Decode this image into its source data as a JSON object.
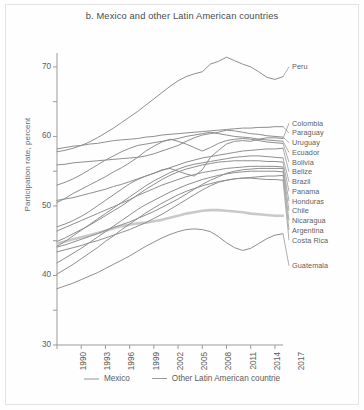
{
  "figure": {
    "panel_letter": "b.",
    "title": "b.  Mexico and other Latin American countries",
    "ylabel": "Participation rate, percent",
    "border_color": "#e3e3e3",
    "background": "#fefefe"
  },
  "legend": {
    "position": "bottom-center",
    "items": [
      {
        "label": "Mexico",
        "color": "#c9c9c9",
        "width": 2.6
      },
      {
        "label": "Other Latin American countrie",
        "color": "#9a9a9a",
        "width": 1.0
      }
    ]
  },
  "chart_data": {
    "type": "line",
    "title": "b.  Mexico and other Latin American countries",
    "xlabel": "",
    "ylabel": "Participation rate, percent",
    "xlim": [
      1990,
      2018
    ],
    "ylim": [
      30,
      72
    ],
    "grid": false,
    "legend_position": "bottom-center",
    "yticks": [
      30,
      40,
      50,
      60,
      70
    ],
    "yticks_minor": [
      35,
      45,
      55,
      65
    ],
    "xticks": [
      1990,
      1993,
      1996,
      1999,
      2002,
      2005,
      2008,
      2011,
      2014,
      2017
    ],
    "x": [
      1990,
      1991,
      1992,
      1993,
      1994,
      1995,
      1996,
      1997,
      1998,
      1999,
      2000,
      2001,
      2002,
      2003,
      2004,
      2005,
      2006,
      2007,
      2008,
      2009,
      2010,
      2011,
      2012,
      2013,
      2014,
      2015,
      2016,
      2017,
      2018
    ],
    "series": [
      {
        "name": "Peru",
        "color": "#8e8e8e",
        "width": 1.0,
        "label_y": 70.0,
        "values": [
          57.8,
          58.0,
          58.3,
          58.7,
          59.2,
          59.8,
          60.5,
          61.2,
          62.0,
          62.8,
          63.6,
          64.5,
          65.4,
          66.3,
          67.2,
          68.0,
          68.6,
          69.0,
          69.3,
          70.4,
          70.8,
          71.4,
          70.9,
          70.4,
          70.0,
          69.3,
          68.5,
          68.2,
          68.6
        ]
      },
      {
        "name": "Colombia",
        "color": "#8e8e8e",
        "width": 1.0,
        "label_y": 61.9,
        "values": [
          47.0,
          47.4,
          47.9,
          48.5,
          49.2,
          50.0,
          50.8,
          51.6,
          52.4,
          53.2,
          53.8,
          54.3,
          54.7,
          55.2,
          55.4,
          55.0,
          54.6,
          54.3,
          55.2,
          57.0,
          58.0,
          58.9,
          59.3,
          59.4,
          59.3,
          59.6,
          59.8,
          59.8,
          59.7
        ]
      },
      {
        "name": "Paraguay",
        "color": "#8e8e8e",
        "width": 1.0,
        "label_y": 60.5,
        "values": [
          58.2,
          58.4,
          58.6,
          58.7,
          58.9,
          59.0,
          59.2,
          59.4,
          59.5,
          59.6,
          59.7,
          59.9,
          60.0,
          60.2,
          60.3,
          60.4,
          60.5,
          60.6,
          60.7,
          60.8,
          60.9,
          61.0,
          61.1,
          61.2,
          61.2,
          61.3,
          61.3,
          61.4,
          61.4
        ]
      },
      {
        "name": "Uruguay",
        "color": "#8e8e8e",
        "width": 1.0,
        "label_y": 59.1,
        "values": [
          55.9,
          56.0,
          56.2,
          56.3,
          56.4,
          56.5,
          56.6,
          56.7,
          56.8,
          56.9,
          57.0,
          57.2,
          57.5,
          57.9,
          58.3,
          58.7,
          59.3,
          59.8,
          60.2,
          60.4,
          60.6,
          60.9,
          60.8,
          60.6,
          60.4,
          60.3,
          60.1,
          60.0,
          59.9
        ]
      },
      {
        "name": "Ecuador",
        "color": "#8e8e8e",
        "width": 1.0,
        "label_y": 57.7,
        "values": [
          53.0,
          53.4,
          53.9,
          54.5,
          55.2,
          55.9,
          56.6,
          57.2,
          57.8,
          58.3,
          58.7,
          58.9,
          59.1,
          59.3,
          59.5,
          59.7,
          60.0,
          60.2,
          60.4,
          60.6,
          60.4,
          60.2,
          60.0,
          59.9,
          59.8,
          59.6,
          59.5,
          59.4,
          59.3
        ]
      },
      {
        "name": "Bolivia",
        "color": "#8e8e8e",
        "width": 1.0,
        "label_y": 56.3,
        "values": [
          50.5,
          51.1,
          51.8,
          52.4,
          53.0,
          53.6,
          54.2,
          54.9,
          55.5,
          56.2,
          57.0,
          57.9,
          58.6,
          59.2,
          59.6,
          59.3,
          58.9,
          58.4,
          57.9,
          58.4,
          59.0,
          59.4,
          59.6,
          59.7,
          59.6,
          59.4,
          59.2,
          59.1,
          59.0
        ]
      },
      {
        "name": "Belize",
        "color": "#8e8e8e",
        "width": 1.0,
        "label_y": 54.9,
        "values": [
          50.8,
          51.0,
          51.2,
          51.5,
          51.8,
          52.1,
          52.4,
          52.8,
          53.1,
          53.5,
          53.9,
          54.3,
          54.7,
          55.1,
          55.5,
          55.9,
          56.3,
          56.6,
          56.9,
          57.1,
          57.3,
          57.5,
          57.7,
          57.9,
          58.0,
          58.1,
          58.2,
          58.2,
          58.3
        ]
      },
      {
        "name": "Brazil",
        "color": "#8e8e8e",
        "width": 1.0,
        "label_y": 53.5,
        "values": [
          44.2,
          44.9,
          45.7,
          46.5,
          47.3,
          48.1,
          48.9,
          49.7,
          50.5,
          51.3,
          52.1,
          52.9,
          53.6,
          54.2,
          54.8,
          55.3,
          55.7,
          56.0,
          56.2,
          56.4,
          56.6,
          56.8,
          57.0,
          57.1,
          57.2,
          57.2,
          57.1,
          57.0,
          56.9
        ]
      },
      {
        "name": "Panama",
        "color": "#8e8e8e",
        "width": 1.0,
        "label_y": 52.1,
        "values": [
          44.9,
          45.4,
          46.0,
          46.6,
          47.2,
          47.9,
          48.6,
          49.3,
          50.0,
          50.8,
          51.6,
          52.4,
          53.1,
          53.8,
          54.4,
          54.9,
          55.3,
          55.6,
          55.9,
          56.1,
          56.3,
          56.4,
          56.5,
          56.5,
          56.5,
          56.5,
          56.4,
          56.4,
          56.3
        ]
      },
      {
        "name": "Honduras",
        "color": "#8e8e8e",
        "width": 1.0,
        "label_y": 50.7,
        "values": [
          46.4,
          46.9,
          47.4,
          47.9,
          48.4,
          48.9,
          49.4,
          49.9,
          50.4,
          50.9,
          51.5,
          52.0,
          52.5,
          53.0,
          53.4,
          53.8,
          54.2,
          54.5,
          54.8,
          55.0,
          55.2,
          55.4,
          55.5,
          55.6,
          55.7,
          55.7,
          55.7,
          55.7,
          55.6
        ]
      },
      {
        "name": "Chile",
        "color": "#8e8e8e",
        "width": 1.0,
        "label_y": 49.3,
        "values": [
          44.1,
          44.4,
          44.8,
          45.2,
          45.6,
          46.0,
          46.5,
          46.9,
          47.3,
          47.7,
          48.2,
          48.7,
          49.2,
          49.8,
          50.4,
          51.0,
          51.7,
          52.4,
          53.1,
          53.7,
          54.2,
          54.7,
          55.0,
          55.2,
          55.3,
          55.4,
          55.4,
          55.4,
          55.4
        ]
      },
      {
        "name": "Nicaragua",
        "color": "#8e8e8e",
        "width": 1.0,
        "label_y": 47.9,
        "values": [
          41.8,
          42.5,
          43.2,
          43.9,
          44.7,
          45.5,
          46.3,
          47.1,
          47.9,
          48.7,
          49.5,
          50.2,
          50.8,
          51.4,
          52.0,
          52.5,
          53.0,
          53.4,
          53.8,
          54.1,
          54.4,
          54.6,
          54.8,
          54.9,
          55.0,
          55.0,
          55.0,
          55.0,
          54.9
        ]
      },
      {
        "name": "Argentina",
        "color": "#8e8e8e",
        "width": 1.0,
        "label_y": 46.5,
        "values": [
          40.2,
          40.9,
          41.6,
          42.4,
          43.2,
          44.0,
          44.9,
          45.7,
          46.6,
          47.4,
          48.2,
          49.0,
          49.7,
          50.4,
          51.0,
          51.6,
          52.1,
          52.5,
          52.9,
          53.2,
          53.5,
          53.7,
          53.9,
          54.0,
          54.1,
          54.2,
          54.3,
          54.3,
          54.4
        ]
      },
      {
        "name": "Costa Rica",
        "color": "#8e8e8e",
        "width": 1.0,
        "label_y": 45.1,
        "values": [
          43.4,
          43.7,
          44.0,
          44.3,
          44.7,
          45.0,
          45.4,
          45.8,
          46.2,
          46.6,
          47.1,
          47.6,
          48.2,
          48.8,
          49.5,
          50.2,
          50.9,
          51.6,
          52.3,
          52.9,
          53.4,
          53.7,
          53.9,
          54.0,
          54.0,
          53.9,
          53.8,
          53.8,
          53.7
        ]
      },
      {
        "name": "Guatemala",
        "color": "#8e8e8e",
        "width": 1.0,
        "label_y": 41.4,
        "values": [
          38.1,
          38.5,
          38.9,
          39.4,
          39.9,
          40.4,
          41.0,
          41.6,
          42.2,
          42.8,
          43.5,
          44.2,
          44.8,
          45.4,
          45.9,
          46.3,
          46.6,
          46.7,
          46.6,
          46.3,
          45.6,
          44.7,
          44.0,
          43.6,
          43.9,
          44.6,
          45.3,
          45.8,
          46.0
        ]
      },
      {
        "name": "Mexico",
        "color": "#c9c9c9",
        "width": 2.6,
        "label_y": null,
        "values": [
          44.6,
          44.9,
          45.2,
          45.5,
          45.8,
          46.1,
          46.4,
          46.8,
          47.1,
          47.3,
          47.5,
          47.6,
          47.8,
          48.0,
          48.3,
          48.6,
          48.9,
          49.1,
          49.3,
          49.4,
          49.4,
          49.3,
          49.2,
          49.1,
          48.9,
          48.8,
          48.7,
          48.6,
          48.6
        ]
      }
    ]
  }
}
